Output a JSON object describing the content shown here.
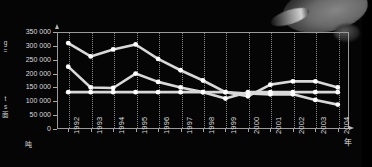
{
  "axis": {
    "y_unit": "吨",
    "x_unit": "年",
    "y_label_chars": [
      "g",
      "=",
      "t",
      "s",
      "面"
    ],
    "y_ticks": [
      "350 000",
      "300 000",
      "250 000",
      "200 000",
      "150 000",
      "100 000",
      "50 000",
      "0"
    ]
  },
  "chart_data": {
    "type": "line",
    "title": "",
    "xlabel": "年",
    "ylabel": "吨",
    "ylim": [
      0,
      350000
    ],
    "grid": true,
    "legend": "none",
    "categories": [
      "1992",
      "1993",
      "1994",
      "1995",
      "1996",
      "1997",
      "1998",
      "1999",
      "2000",
      "2001",
      "2002",
      "2003",
      "2004"
    ],
    "series": [
      {
        "name": "series-1",
        "values": [
          310000,
          262000,
          287000,
          305000,
          253000,
          212000,
          175000,
          133000,
          118000,
          160000,
          172000,
          172000,
          150000
        ]
      },
      {
        "name": "series-2",
        "values": [
          225000,
          150000,
          148000,
          200000,
          170000,
          150000,
          133000,
          110000,
          133000,
          133000,
          133000,
          133000,
          133000
        ]
      },
      {
        "name": "series-3",
        "values": [
          133000,
          133000,
          133000,
          133000,
          133000,
          133000,
          133000,
          133000,
          128000,
          125000,
          125000,
          105000,
          88000
        ]
      }
    ]
  }
}
